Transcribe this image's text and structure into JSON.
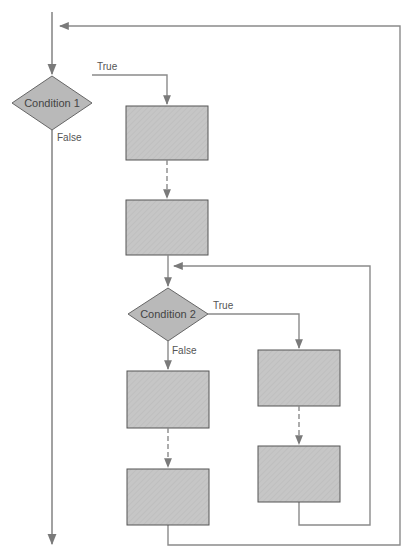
{
  "diagram": {
    "type": "flowchart",
    "colors": {
      "line": "#8a8a8a",
      "box_fill": "#c4c4c4",
      "box_stroke": "#555555",
      "diamond_fill": "#b8b8b8",
      "background": "#ffffff"
    },
    "decisions": [
      {
        "id": "condition-1",
        "label": "Condition 1",
        "true_label": "True",
        "false_label": "False"
      },
      {
        "id": "condition-2",
        "label": "Condition 2",
        "true_label": "True",
        "false_label": "False"
      }
    ],
    "process_boxes": [
      {
        "id": "box-a",
        "branch": "condition-1 true",
        "label": ""
      },
      {
        "id": "box-b",
        "branch": "condition-1 true",
        "label": ""
      },
      {
        "id": "box-c",
        "branch": "condition-2 false",
        "label": ""
      },
      {
        "id": "box-d",
        "branch": "condition-2 false",
        "label": ""
      },
      {
        "id": "box-e",
        "branch": "condition-2 true",
        "label": ""
      },
      {
        "id": "box-f",
        "branch": "condition-2 true",
        "label": ""
      }
    ],
    "loops": [
      {
        "id": "outer-loop",
        "from": "box-d",
        "to": "before condition-1"
      },
      {
        "id": "inner-loop",
        "from": "box-f",
        "to": "before condition-2"
      }
    ]
  }
}
